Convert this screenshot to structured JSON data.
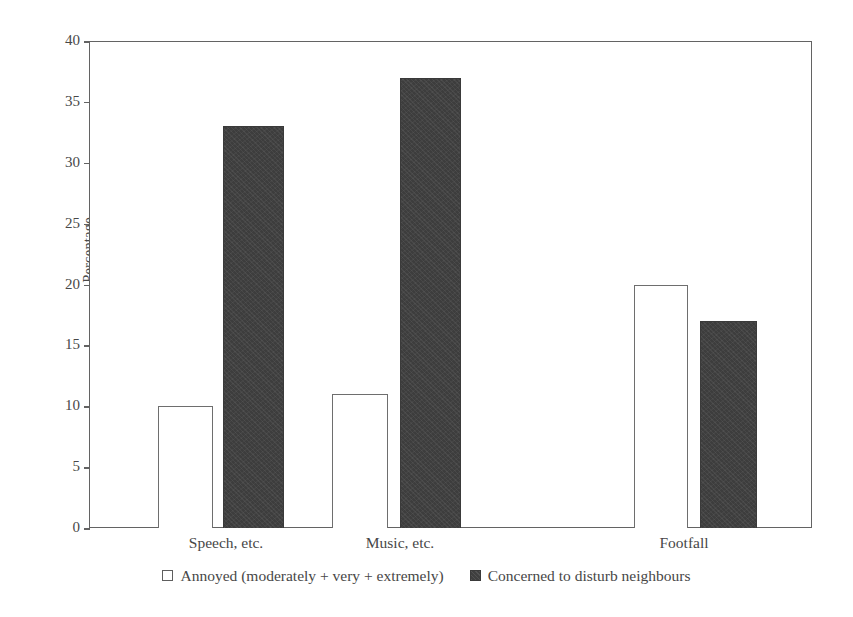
{
  "chart_data": {
    "type": "bar",
    "title": "",
    "subtitle": "",
    "xlabel": "",
    "ylabel": "Percentage",
    "ylim": [
      0,
      40
    ],
    "yticks": [
      0,
      5,
      10,
      15,
      20,
      25,
      30,
      35,
      40
    ],
    "ytick_labels": [
      "0",
      "5",
      "10",
      "15",
      "20",
      "25",
      "30",
      "35",
      "40"
    ],
    "grid": false,
    "legend_position": "bottom",
    "categories": [
      "Speech, etc.",
      "Music, etc.",
      "Footfall"
    ],
    "series": [
      {
        "name": "Annoyed (moderately + very + extremely)",
        "marker": "open-square",
        "color": "#ffffff",
        "edge_color": "#6e6e6e",
        "values": [
          10,
          11,
          20
        ]
      },
      {
        "name": "Concerned to disturb neighbours",
        "marker": "filled-square",
        "color": "#3d3d3d",
        "edge_color": "#3a3a3a",
        "values": [
          33,
          37,
          17
        ]
      }
    ],
    "annotations": []
  },
  "axis": {
    "y_title": "Percentage",
    "ticks": [
      {
        "label": "40",
        "value": 40
      },
      {
        "label": "35",
        "value": 35
      },
      {
        "label": "30",
        "value": 30
      },
      {
        "label": "25",
        "value": 25
      },
      {
        "label": "20",
        "value": 20
      },
      {
        "label": "15",
        "value": 15
      },
      {
        "label": "10",
        "value": 10
      },
      {
        "label": "5",
        "value": 5
      },
      {
        "label": "0",
        "value": 0
      }
    ]
  },
  "categories": [
    {
      "label": "Speech, etc."
    },
    {
      "label": "Music, etc."
    },
    {
      "label": "Footfall"
    }
  ],
  "legend": {
    "items": [
      {
        "label": "Annoyed (moderately + very + extremely)",
        "marker": "open-square"
      },
      {
        "label": "Concerned to disturb neighbours",
        "marker": "filled-square"
      }
    ]
  }
}
